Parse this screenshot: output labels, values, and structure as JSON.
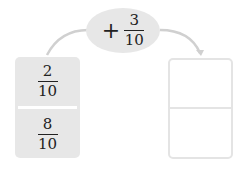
{
  "diagram": {
    "operation": {
      "operator": "+",
      "numerator": "3",
      "denominator": "10"
    },
    "source_card": {
      "top": {
        "numerator": "2",
        "denominator": "10"
      },
      "bottom": {
        "numerator": "8",
        "denominator": "10"
      }
    },
    "result_card": {
      "top": "",
      "bottom": ""
    },
    "colors": {
      "fill": "#e7e7e7",
      "arrow": "#cfcfcf",
      "text": "#222222"
    }
  }
}
